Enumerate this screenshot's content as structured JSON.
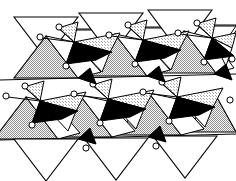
{
  "figure": {
    "kind": "crystal-structure-polyhedral-diagram",
    "caption": "",
    "title": "",
    "width": 236,
    "height": 181,
    "background_color": "#ffffff",
    "line_color": "#000000",
    "stipple_color": "#9a9a9a",
    "stipple_light_color": "#c9c9c9",
    "black_fill_color": "#000000",
    "white_fill_color": "#ffffff",
    "circle_fill_color": "#ffffff",
    "stroke_width": 1.0,
    "atom_radius": 3.1,
    "legend_items": [],
    "axis_labels": [],
    "annotations": [],
    "counts": {
      "white_triangles_top_row": 4,
      "white_triangles_bottom_row": 3,
      "stippled_tetrahedra": 14,
      "black_wedges": 12,
      "atom_circles": 26,
      "rows": 2
    },
    "polyhedra": {
      "white_up": [
        [
          [
            14,
            57
          ],
          [
            79,
            57
          ],
          [
            47,
            13
          ]
        ],
        [
          [
            87,
            54
          ],
          [
            150,
            54
          ],
          [
            118,
            10
          ]
        ],
        [
          [
            158,
            52
          ],
          [
            221,
            52
          ],
          [
            190,
            9
          ]
        ],
        [
          [
            52,
            150
          ],
          [
            114,
            150
          ],
          [
            83,
            108
          ]
        ],
        [
          [
            124,
            148
          ],
          [
            186,
            148
          ],
          [
            155,
            106
          ]
        ]
      ],
      "white_down": [
        [
          [
            16,
            11
          ],
          [
            80,
            11
          ],
          [
            48,
            57
          ]
        ],
        [
          [
            88,
            9
          ],
          [
            152,
            9
          ],
          [
            120,
            55
          ]
        ],
        [
          [
            159,
            8
          ],
          [
            223,
            8
          ],
          [
            191,
            54
          ]
        ],
        [
          [
            18,
            131
          ],
          [
            82,
            131
          ],
          [
            50,
            178
          ]
        ],
        [
          [
            90,
            129
          ],
          [
            154,
            129
          ],
          [
            122,
            176
          ]
        ],
        [
          [
            161,
            128
          ],
          [
            225,
            128
          ],
          [
            193,
            174
          ]
        ]
      ],
      "stippled_up": [
        [
          [
            14,
            57
          ],
          [
            79,
            57
          ],
          [
            47,
            13
          ]
        ],
        [
          [
            87,
            54
          ],
          [
            150,
            54
          ],
          [
            118,
            10
          ]
        ],
        [
          [
            158,
            52
          ],
          [
            221,
            52
          ],
          [
            190,
            9
          ]
        ],
        [
          [
            52,
            150
          ],
          [
            114,
            150
          ],
          [
            83,
            108
          ]
        ],
        [
          [
            124,
            148
          ],
          [
            186,
            148
          ],
          [
            155,
            106
          ]
        ]
      ],
      "black_wedges": [
        [
          [
            72,
            44
          ],
          [
            96,
            58
          ],
          [
            66,
            62
          ]
        ],
        [
          [
            143,
            42
          ],
          [
            167,
            56
          ],
          [
            137,
            60
          ]
        ],
        [
          [
            38,
            85
          ],
          [
            62,
            99
          ],
          [
            32,
            103
          ]
        ],
        [
          [
            110,
            83
          ],
          [
            134,
            97
          ],
          [
            104,
            101
          ]
        ],
        [
          [
            181,
            81
          ],
          [
            205,
            95
          ],
          [
            175,
            99
          ]
        ]
      ]
    }
  }
}
